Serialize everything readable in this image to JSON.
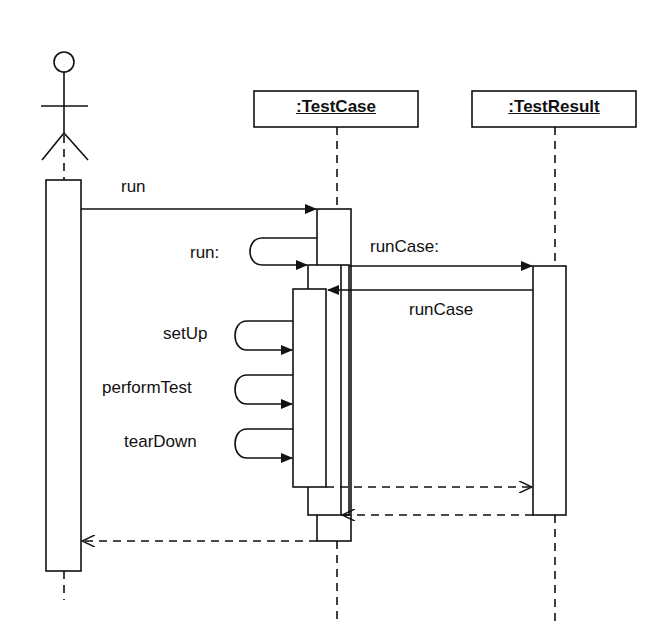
{
  "diagram": {
    "type": "UML sequence diagram",
    "actor": {
      "name": "actor"
    },
    "objects": [
      {
        "label": ":TestCase"
      },
      {
        "label": ":TestResult"
      }
    ],
    "messages": [
      {
        "label": "run",
        "from": "actor",
        "to": ":TestCase",
        "kind": "sync"
      },
      {
        "label": "run:",
        "from": ":TestCase",
        "to": ":TestCase",
        "kind": "self"
      },
      {
        "label": "runCase:",
        "from": ":TestCase",
        "to": ":TestResult",
        "kind": "sync"
      },
      {
        "label": "runCase",
        "from": ":TestResult",
        "to": ":TestCase",
        "kind": "sync"
      },
      {
        "label": "setUp",
        "from": ":TestCase",
        "to": ":TestCase",
        "kind": "self"
      },
      {
        "label": "performTest",
        "from": ":TestCase",
        "to": ":TestCase",
        "kind": "self"
      },
      {
        "label": "tearDown",
        "from": ":TestCase",
        "to": ":TestCase",
        "kind": "self"
      },
      {
        "label": "",
        "from": ":TestCase",
        "to": ":TestResult",
        "kind": "return"
      },
      {
        "label": "",
        "from": ":TestResult",
        "to": ":TestCase",
        "kind": "return"
      },
      {
        "label": "",
        "from": ":TestCase",
        "to": "actor",
        "kind": "return"
      }
    ]
  }
}
